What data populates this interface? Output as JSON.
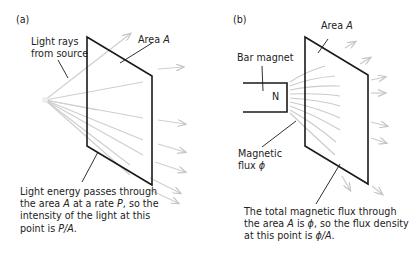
{
  "panel_a": {
    "tag": "(a)",
    "label_rays_1": "Light rays",
    "label_rays_2": "from source",
    "label_area_prefix": "Area ",
    "label_area_sym": "A",
    "caption": [
      [
        "Light energy passes through"
      ],
      [
        "the area ",
        "A",
        " at a rate ",
        "P",
        ", so the"
      ],
      [
        "intensity of the light at this"
      ],
      [
        "point is ",
        "P/A",
        "."
      ]
    ]
  },
  "panel_b": {
    "tag": "(b)",
    "label_area_prefix": "Area ",
    "label_area_sym": "A",
    "label_magnet": "Bar magnet",
    "magnet_pole": "N",
    "label_flux_1": "Magnetic",
    "label_flux_2": "flux ",
    "label_flux_sym": "ϕ",
    "caption": [
      [
        "The total magnetic flux through"
      ],
      [
        "the area ",
        "A",
        " is ",
        "ϕ",
        ", so the flux density"
      ],
      [
        "at this point is ",
        "ϕ/A",
        "."
      ]
    ]
  },
  "colors": {
    "outline": "#1a1a1a",
    "ray": "#c8c8c8",
    "text": "#222222"
  }
}
